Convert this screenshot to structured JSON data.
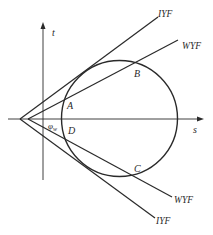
{
  "diagram": {
    "type": "mohr-circle-yield-surface",
    "axes": {
      "horizontal_label": "s",
      "vertical_label": "t"
    },
    "angle_label": "φ",
    "angle_subscript": "w",
    "points": {
      "A": "A",
      "B": "B",
      "C": "C",
      "D": "D"
    },
    "lines": {
      "upper_outer": "IYF",
      "upper_inner": "WYF",
      "lower_inner": "WYF",
      "lower_outer": "IYF"
    },
    "colors": {
      "stroke": "#2a2a2a",
      "background": "#ffffff"
    }
  }
}
